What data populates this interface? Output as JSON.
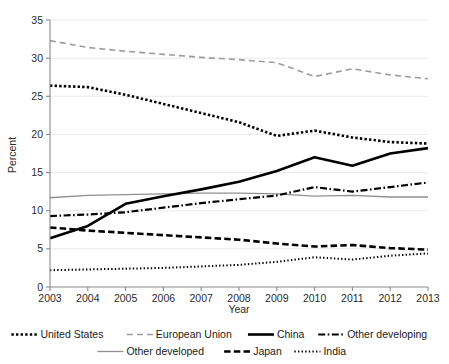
{
  "chart_data": {
    "type": "line",
    "title": "",
    "xlabel": "Year",
    "ylabel": "Percent",
    "x": [
      2003,
      2004,
      2005,
      2006,
      2007,
      2008,
      2009,
      2010,
      2011,
      2012,
      2013
    ],
    "xtick_labels": [
      "2003",
      "2004",
      "2005",
      "2006",
      "2007",
      "2008",
      "2009",
      "2010",
      "2011",
      "2012",
      "2013"
    ],
    "ytick_labels": [
      "0",
      "5",
      "10",
      "15",
      "20",
      "25",
      "30",
      "35"
    ],
    "yticks": [
      0,
      5,
      10,
      15,
      20,
      25,
      30,
      35
    ],
    "ylim": [
      0,
      35
    ],
    "xlim": [
      2003,
      2013
    ],
    "grid": true,
    "legend_position": "below",
    "series": [
      {
        "name": "United States",
        "values": [
          26.4,
          26.2,
          25.2,
          24.0,
          22.8,
          21.6,
          19.8,
          20.5,
          19.6,
          19.0,
          18.8
        ],
        "color": "#000000",
        "style": "dotted-thick",
        "width": 2.6,
        "dash": "2.4 2.2"
      },
      {
        "name": "European Union",
        "values": [
          32.3,
          31.4,
          30.9,
          30.5,
          30.1,
          29.8,
          29.4,
          27.6,
          28.6,
          27.8,
          27.3
        ],
        "color": "#9b9b9b",
        "style": "dashed",
        "width": 1.6,
        "dash": "6 4"
      },
      {
        "name": "China",
        "values": [
          6.4,
          8.0,
          10.9,
          11.9,
          12.8,
          13.8,
          15.2,
          17.0,
          15.9,
          17.5,
          18.2
        ],
        "color": "#000000",
        "style": "solid-thick",
        "width": 2.6,
        "dash": "none"
      },
      {
        "name": "Other developing",
        "values": [
          9.3,
          9.5,
          9.8,
          10.4,
          11.0,
          11.5,
          12.0,
          13.1,
          12.5,
          13.1,
          13.7
        ],
        "color": "#000000",
        "style": "dash-dot",
        "width": 2.2,
        "dash": "7 2.5 1.6 2.5"
      },
      {
        "name": "Other developed",
        "values": [
          11.7,
          12.0,
          12.1,
          12.2,
          12.3,
          12.3,
          12.2,
          11.9,
          12.0,
          11.8,
          11.8
        ],
        "color": "#8f8f8f",
        "style": "solid-thin",
        "width": 1.3,
        "dash": "none"
      },
      {
        "name": "Japan",
        "values": [
          7.8,
          7.4,
          7.1,
          6.8,
          6.5,
          6.2,
          5.7,
          5.3,
          5.5,
          5.1,
          4.9
        ],
        "color": "#000000",
        "style": "dashed-thick",
        "width": 2.6,
        "dash": "6.5 3.2"
      },
      {
        "name": "India",
        "values": [
          2.2,
          2.3,
          2.4,
          2.5,
          2.7,
          2.9,
          3.3,
          3.9,
          3.6,
          4.1,
          4.4
        ],
        "color": "#000000",
        "style": "dotted-fine",
        "width": 2.0,
        "dash": "1.4 2.2"
      }
    ]
  },
  "legend": {
    "row1": [
      {
        "label": "United States",
        "key": "United States"
      },
      {
        "label": "European Union",
        "key": "European Union"
      },
      {
        "label": "China",
        "key": "China"
      },
      {
        "label": "Other developing",
        "key": "Other developing"
      }
    ],
    "row2": [
      {
        "label": "Other developed",
        "key": "Other developed"
      },
      {
        "label": "Japan",
        "key": "Japan"
      },
      {
        "label": "India",
        "key": "India"
      }
    ]
  },
  "axes": {
    "y_axis_title": "Percent",
    "x_axis_title": "Year"
  }
}
